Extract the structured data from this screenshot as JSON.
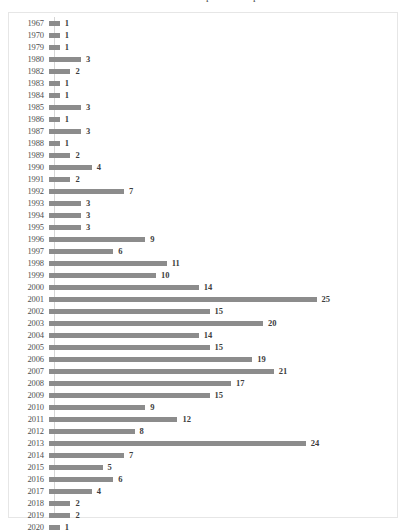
{
  "chart_data": {
    "type": "bar",
    "orientation": "horizontal",
    "title": "Dis. de amistad escolar por año de publicación",
    "xlabel": "",
    "ylabel": "",
    "grid": false,
    "legend": false,
    "show_data_labels": true,
    "xlim": [
      0,
      25
    ],
    "bar_color": "#8c8c8c",
    "categories": [
      "1967",
      "1970",
      "1979",
      "1980",
      "1982",
      "1983",
      "1984",
      "1985",
      "1986",
      "1987",
      "1988",
      "1989",
      "1990",
      "1991",
      "1992",
      "1993",
      "1994",
      "1995",
      "1996",
      "1997",
      "1998",
      "1999",
      "2000",
      "2001",
      "2002",
      "2003",
      "2004",
      "2005",
      "2006",
      "2007",
      "2008",
      "2009",
      "2010",
      "2011",
      "2012",
      "2013",
      "2014",
      "2015",
      "2016",
      "2017",
      "2018",
      "2019",
      "2020"
    ],
    "values": [
      1,
      1,
      1,
      3,
      2,
      1,
      1,
      3,
      1,
      3,
      1,
      2,
      4,
      2,
      7,
      3,
      3,
      3,
      9,
      6,
      11,
      10,
      14,
      25,
      15,
      20,
      14,
      15,
      19,
      21,
      17,
      15,
      9,
      12,
      8,
      24,
      7,
      5,
      6,
      4,
      2,
      2,
      1
    ]
  }
}
